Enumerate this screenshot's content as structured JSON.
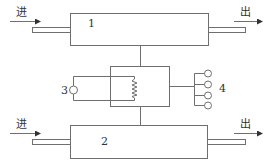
{
  "diagram": {
    "units": {
      "unit1": {
        "label": "1",
        "inlet_label": "进",
        "outlet_label": "出"
      },
      "unit2": {
        "label": "2",
        "inlet_label": "进",
        "outlet_label": "出"
      }
    },
    "sensor": {
      "label": "3"
    },
    "terminals": {
      "label": "4",
      "count": 4
    },
    "colors": {
      "line": "#6f6f6f",
      "text": "#333333",
      "background": "#ffffff"
    }
  }
}
